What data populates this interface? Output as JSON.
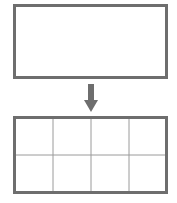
{
  "diagram": {
    "colors": {
      "outline": "#6e6e6e",
      "grid_line": "#9a9a9a",
      "arrow": "#6e6e6e",
      "background": "#ffffff"
    },
    "top_box": {
      "rows": 1,
      "cols": 1
    },
    "arrow": {
      "direction": "down"
    },
    "bottom_grid": {
      "rows": 2,
      "cols": 4
    }
  }
}
